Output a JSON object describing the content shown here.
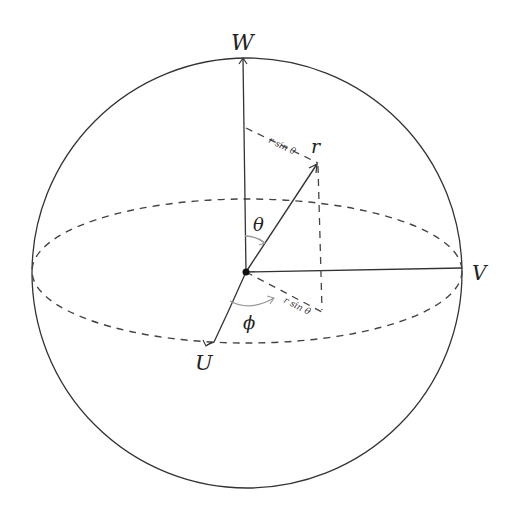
{
  "diagram": {
    "type": "spherical-coordinates",
    "axes": {
      "w_label": "W",
      "v_label": "V",
      "u_label": "U"
    },
    "vector_label": "r",
    "angles": {
      "polar": "θ",
      "azimuthal": "ϕ"
    },
    "projections": {
      "upper": "r sin θ",
      "lower": "r sin θ"
    },
    "colors": {
      "line": "#333333",
      "dashed": "#444444",
      "angle_arc": "#999999",
      "background": "#ffffff"
    }
  }
}
